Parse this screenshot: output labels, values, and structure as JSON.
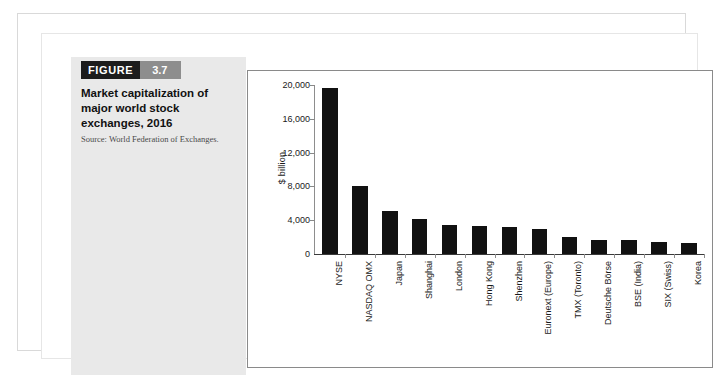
{
  "figure": {
    "badge_word": "FIGURE",
    "badge_number": "3.7",
    "title": "Market capitalization of major world stock exchanges, 2016",
    "source": "Source: World Federation of Exchanges."
  },
  "colors": {
    "badge_dark": "#1c1c1c",
    "badge_gray": "#8d8d8d",
    "bar": "#111111",
    "axis": "#8d8d8d",
    "caption_panel": "#e9e9e9",
    "page_background": "#ffffff"
  },
  "chart_data": {
    "type": "bar",
    "title": "Market capitalization of major world stock exchanges, 2016",
    "xlabel": "",
    "ylabel": "$ billion",
    "ylim": [
      0,
      20000
    ],
    "yticks": [
      0,
      4000,
      8000,
      12000,
      16000,
      20000
    ],
    "ytick_labels": [
      "0",
      "4,000",
      "8,000",
      "12,000",
      "16,000",
      "20,000"
    ],
    "grid": false,
    "legend": false,
    "categories": [
      "NYSE",
      "NASDAQ OMX",
      "Japan",
      "Shanghai",
      "London",
      "Hong Kong",
      "Shenzhen",
      "Euronext (Europe)",
      "TMX (Toronto)",
      "Deutsche Börse",
      "BSE (India)",
      "SIX (Swiss)",
      "Korea"
    ],
    "values": [
      19600,
      8000,
      5100,
      4100,
      3400,
      3300,
      3200,
      3000,
      2000,
      1700,
      1650,
      1450,
      1250
    ]
  }
}
